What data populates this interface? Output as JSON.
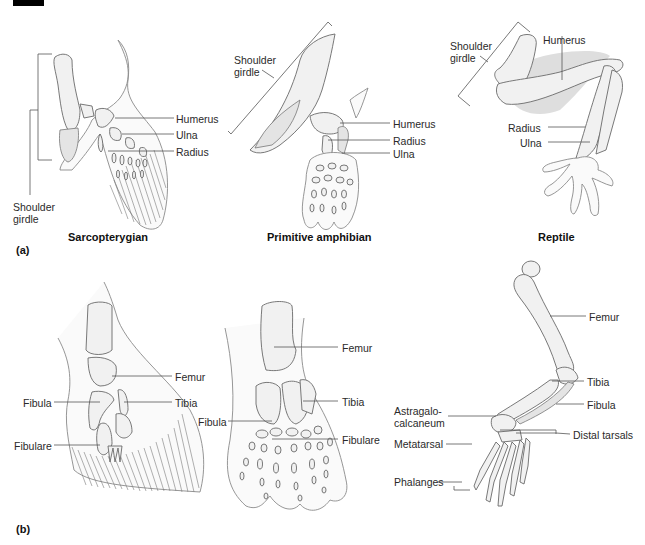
{
  "figure": {
    "panels": [
      {
        "id": "a",
        "label": "(a)",
        "subfigures": [
          {
            "title": "Sarcopterygian",
            "labels": {
              "humerus": "Humerus",
              "ulna": "Ulna",
              "radius": "Radius",
              "shoulder_girdle_line1": "Shoulder",
              "shoulder_girdle_line2": "girdle"
            }
          },
          {
            "title": "Primitive amphibian",
            "labels": {
              "shoulder_girdle_line1": "Shoulder",
              "shoulder_girdle_line2": "girdle",
              "humerus": "Humerus",
              "radius": "Radius",
              "ulna": "Ulna"
            }
          },
          {
            "title": "Reptile",
            "labels": {
              "shoulder_girdle_line1": "Shoulder",
              "shoulder_girdle_line2": "girdle",
              "humerus": "Humerus",
              "radius": "Radius",
              "ulna": "Ulna"
            }
          }
        ]
      },
      {
        "id": "b",
        "label": "(b)",
        "subfigures": [
          {
            "title": "",
            "labels": {
              "femur": "Femur",
              "fibula": "Fibula",
              "tibia": "Tibia",
              "fibulare": "Fibulare"
            }
          },
          {
            "title": "",
            "labels": {
              "femur": "Femur",
              "tibia": "Tibia",
              "fibula": "Fibula",
              "fibulare": "Fibulare"
            }
          },
          {
            "title": "",
            "labels": {
              "femur": "Femur",
              "tibia": "Tibia",
              "fibula": "Fibula",
              "astragalo_line1": "Astragalo-",
              "astragalo_line2": "calcaneum",
              "distal_tarsals": "Distal tarsals",
              "metatarsal": "Metatarsal",
              "phalanges": "Phalanges"
            }
          }
        ]
      }
    ]
  },
  "colors": {
    "background": "#ffffff",
    "bone_fill": "#f1f1f1",
    "outline": "#6a6a6a",
    "text": "#2a2a2a",
    "corner_block": "#000000"
  }
}
